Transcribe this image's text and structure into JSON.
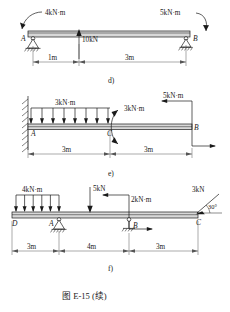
{
  "figure": {
    "caption": "图  E-15 (续)",
    "caption_number": "E-15"
  },
  "diagrams": [
    {
      "key": "d",
      "sublabel": "d)",
      "supports": [
        {
          "point": "A",
          "type": "pin-support"
        },
        {
          "point": "B",
          "type": "roller-support"
        }
      ],
      "point_labels": [
        "A",
        "B"
      ],
      "loads": [
        {
          "name": "moment-left",
          "value": "4kN·m",
          "type": "couple",
          "at": "A"
        },
        {
          "name": "point-load",
          "value": "10kN",
          "type": "force-up",
          "at": "1m from A"
        },
        {
          "name": "moment-right",
          "value": "5kN·m",
          "type": "couple",
          "at": "B"
        }
      ],
      "dimensions": [
        "1m",
        "3m"
      ]
    },
    {
      "key": "e",
      "sublabel": "e)",
      "supports": [
        {
          "point": "A",
          "type": "fixed-wall"
        }
      ],
      "point_labels": [
        "A",
        "C",
        "B"
      ],
      "loads": [
        {
          "name": "distributed-load",
          "value": "3kN·m",
          "type": "udl-down",
          "span": "A to C"
        },
        {
          "name": "moment-mid",
          "value": "3kN·m",
          "type": "couple",
          "at": "C"
        },
        {
          "name": "moment-right",
          "value": "5kN·m",
          "type": "couple",
          "at": "B"
        }
      ],
      "dimensions": [
        "3m",
        "3m"
      ]
    },
    {
      "key": "f",
      "sublabel": "f)",
      "supports": [
        {
          "point": "A",
          "type": "pin-support"
        },
        {
          "point": "B",
          "type": "roller-support"
        }
      ],
      "point_labels": [
        "D",
        "A",
        "B",
        "C"
      ],
      "loads": [
        {
          "name": "distributed-load",
          "value": "4kN·m",
          "type": "udl-down",
          "span": "D to A"
        },
        {
          "name": "point-load",
          "value": "5kN",
          "type": "force-down",
          "at": "mid span"
        },
        {
          "name": "moment-at-b",
          "value": "2kN·m",
          "type": "couple",
          "at": "B"
        },
        {
          "name": "inclined-load",
          "value": "3kN",
          "type": "force-inclined",
          "at": "C",
          "angle": "30°"
        }
      ],
      "angle_label": "30°",
      "dimensions": [
        "3m",
        "4m",
        "3m"
      ]
    }
  ],
  "colors": {
    "ink": "#1a1a1a",
    "beam_fill": "#d8d8d8",
    "dim_line": "#555555",
    "page": "#ffffff"
  }
}
